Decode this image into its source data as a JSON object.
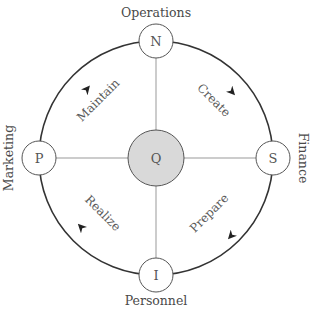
{
  "diagram": {
    "center": {
      "letter": "Q",
      "fill": "#d9d9d9"
    },
    "nodes": {
      "top": {
        "letter": "N",
        "label": "Operations"
      },
      "right": {
        "letter": "S",
        "label": "Finance"
      },
      "bottom": {
        "letter": "I",
        "label": "Personnel"
      },
      "left": {
        "letter": "P",
        "label": "Marketing"
      }
    },
    "quadrants": {
      "top_left": "Maintain",
      "top_right": "Create",
      "bottom_right": "Prepare",
      "bottom_left": "Realize"
    },
    "flow_direction": "clockwise",
    "colors": {
      "stroke": "#333333",
      "spoke": "#999999",
      "text": "#4a4a4a"
    }
  }
}
